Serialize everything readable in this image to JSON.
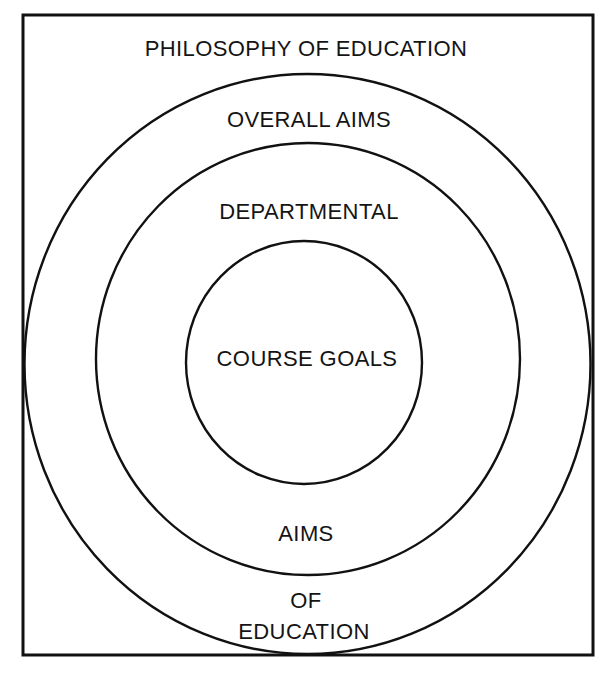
{
  "diagram": {
    "title": "PHILOSOPHY OF EDUCATION",
    "rings": [
      {
        "id": "outer",
        "top_label": "OVERALL AIMS",
        "bottom_label_line1": "OF",
        "bottom_label_line2": "EDUCATION"
      },
      {
        "id": "middle",
        "top_label": "DEPARTMENTAL",
        "bottom_label": "AIMS"
      },
      {
        "id": "inner",
        "center_label": "COURSE GOALS"
      }
    ],
    "colors": {
      "stroke": "#111111",
      "text": "#141414",
      "background": "#ffffff"
    }
  }
}
